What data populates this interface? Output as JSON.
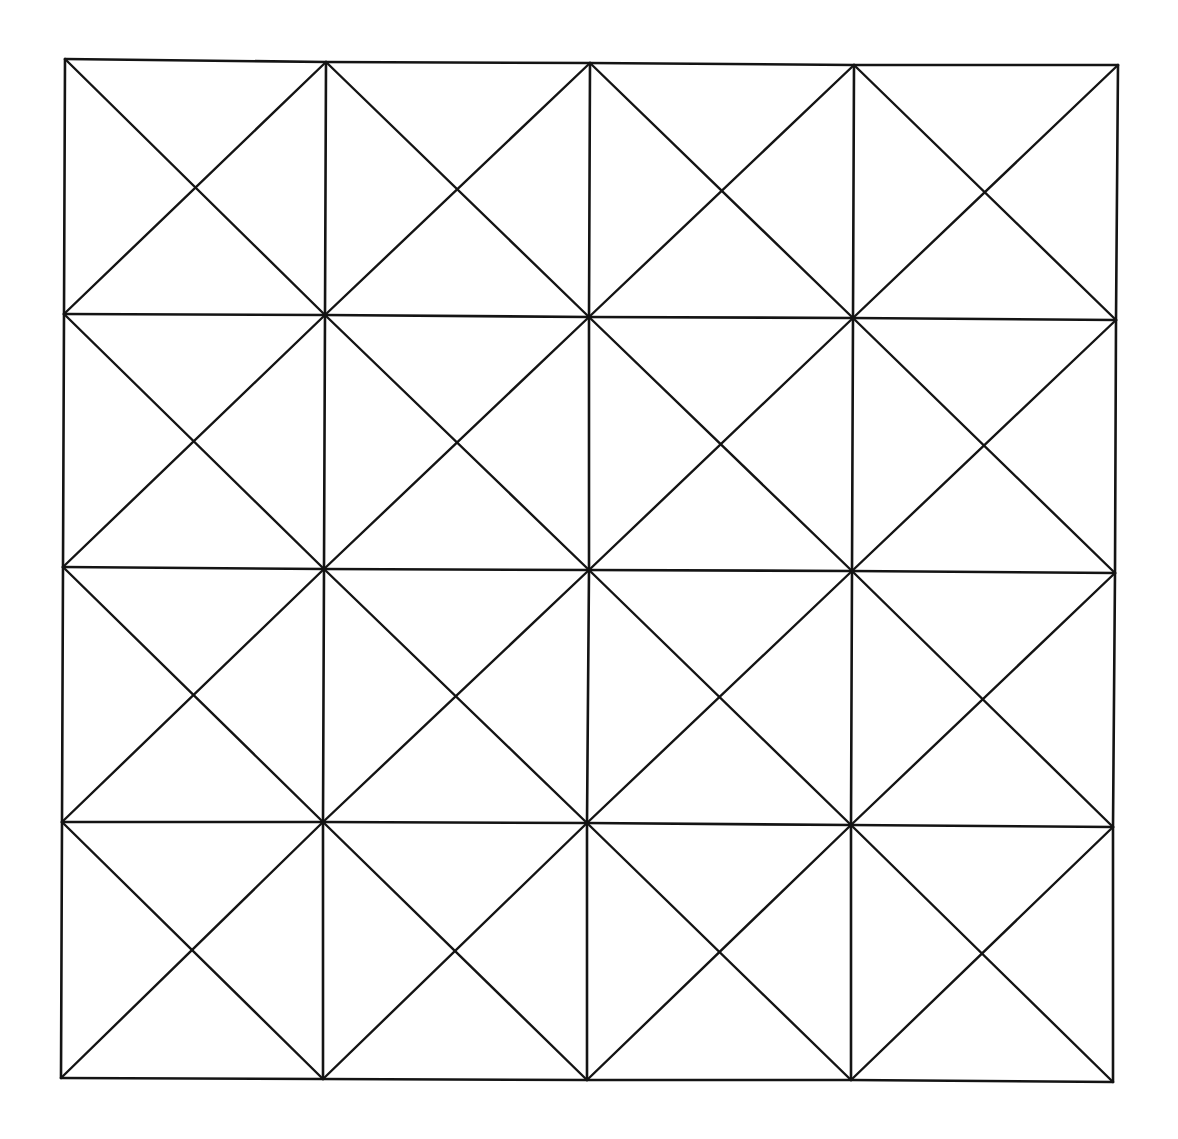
{
  "diagram": {
    "title": "",
    "rows": 4,
    "cols": 4,
    "stroke_color": "#141414",
    "background_color": "#ffffff",
    "nodes": [
      [
        [
          65,
          59
        ],
        [
          326,
          62
        ],
        [
          590,
          63
        ],
        [
          854,
          65
        ],
        [
          1118,
          65
        ]
      ],
      [
        [
          64,
          314
        ],
        [
          325,
          315
        ],
        [
          589,
          317
        ],
        [
          853,
          318
        ],
        [
          1116,
          320
        ]
      ],
      [
        [
          63,
          567
        ],
        [
          324,
          569
        ],
        [
          589,
          570
        ],
        [
          852,
          571
        ],
        [
          1115,
          573
        ]
      ],
      [
        [
          62,
          822
        ],
        [
          323,
          822
        ],
        [
          587,
          823
        ],
        [
          851,
          825
        ],
        [
          1113,
          827
        ]
      ],
      [
        [
          61,
          1078
        ],
        [
          323,
          1079
        ],
        [
          587,
          1080
        ],
        [
          851,
          1080
        ],
        [
          1113,
          1082
        ]
      ]
    ]
  }
}
